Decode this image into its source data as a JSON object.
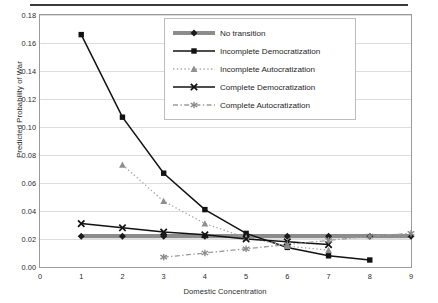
{
  "chart": {
    "type": "line",
    "title": "",
    "xlabel": "Domestic Concentration",
    "ylabel": "Predicted Probability of War",
    "xlim": [
      0,
      9
    ],
    "ylim": [
      0,
      0.18
    ],
    "xticks": [
      "0",
      "1",
      "2",
      "3",
      "4",
      "5",
      "6",
      "7",
      "8",
      "9"
    ],
    "xtick_values": [
      0,
      1,
      2,
      3,
      4,
      5,
      6,
      7,
      8,
      9
    ],
    "yticks": [
      "0.00",
      "0.02",
      "0.04",
      "0.06",
      "0.08",
      "0.10",
      "0.12",
      "0.14",
      "0.16",
      "0.18"
    ],
    "ytick_values": [
      0.0,
      0.02,
      0.04,
      0.06,
      0.08,
      0.1,
      0.12,
      0.14,
      0.16,
      0.18
    ],
    "grid": "horizontal",
    "legend_position": "top-center",
    "series": [
      {
        "name": "No transition",
        "marker": "diamond",
        "linestyle": "solid-thick",
        "color": "#8c8c8c",
        "marker_color": "#1a1a1a",
        "x": [
          1,
          2,
          3,
          4,
          5,
          6,
          7,
          8,
          9
        ],
        "values": [
          0.022,
          0.022,
          0.022,
          0.022,
          0.022,
          0.022,
          0.022,
          0.022,
          0.022
        ]
      },
      {
        "name": "Incomplete Democratization",
        "marker": "square",
        "linestyle": "solid",
        "color": "#121212",
        "marker_color": "#121212",
        "x": [
          1,
          2,
          3,
          4,
          5,
          6,
          7,
          8
        ],
        "values": [
          0.166,
          0.107,
          0.067,
          0.041,
          0.024,
          0.014,
          0.008,
          0.005
        ]
      },
      {
        "name": "Incomplete Autocratization",
        "marker": "triangle",
        "linestyle": "dotted",
        "color": "#a8a8a8",
        "marker_color": "#8f8f8f",
        "x": [
          2,
          3,
          4,
          5,
          6,
          7
        ],
        "values": [
          0.073,
          0.047,
          0.031,
          0.021,
          0.015,
          0.012
        ]
      },
      {
        "name": "Complete Democratization",
        "marker": "cross",
        "linestyle": "solid",
        "color": "#121212",
        "marker_color": "#121212",
        "x": [
          1,
          2,
          3,
          4,
          5,
          6,
          7
        ],
        "values": [
          0.031,
          0.028,
          0.025,
          0.023,
          0.02,
          0.018,
          0.016
        ]
      },
      {
        "name": "Complete Autocratization",
        "marker": "asterisk",
        "linestyle": "dashdot",
        "color": "#9a9a9a",
        "marker_color": "#8a8a8a",
        "x": [
          3,
          4,
          5,
          6,
          7,
          8,
          9
        ],
        "values": [
          0.007,
          0.01,
          0.013,
          0.016,
          0.019,
          0.022,
          0.024
        ]
      }
    ]
  }
}
